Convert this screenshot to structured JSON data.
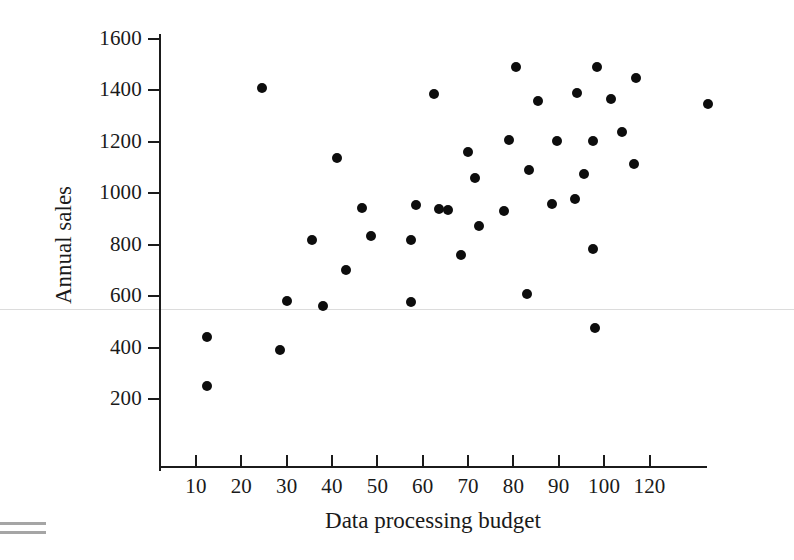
{
  "chart_data": {
    "type": "scatter",
    "title": "",
    "xlabel": "Data processing budget",
    "ylabel": "Annual sales",
    "xlim": [
      0,
      130
    ],
    "ylim": [
      0,
      1700
    ],
    "grid": false,
    "legend": "none",
    "marker": "filled-circle",
    "marker_color": "#0d0d0d",
    "xticks": [
      10,
      20,
      30,
      40,
      50,
      60,
      70,
      80,
      90,
      100,
      120
    ],
    "xtick_labels": [
      "10",
      "20",
      "30",
      "40",
      "50",
      "60",
      "70",
      "80",
      "90",
      "100",
      "120"
    ],
    "yticks": [
      200,
      400,
      600,
      800,
      1000,
      1200,
      1400,
      1600
    ],
    "ytick_labels": [
      "200",
      "400",
      "600",
      "800",
      "1000",
      "1200",
      "1400",
      "1600"
    ],
    "n_points": 44,
    "points": [
      {
        "x": 12.5,
        "y": 440
      },
      {
        "x": 12.5,
        "y": 250
      },
      {
        "x": 24.5,
        "y": 1410
      },
      {
        "x": 28.5,
        "y": 392
      },
      {
        "x": 30.0,
        "y": 583
      },
      {
        "x": 35.5,
        "y": 818
      },
      {
        "x": 38.0,
        "y": 563
      },
      {
        "x": 41.0,
        "y": 1138
      },
      {
        "x": 43.0,
        "y": 703
      },
      {
        "x": 46.5,
        "y": 944
      },
      {
        "x": 48.5,
        "y": 833
      },
      {
        "x": 57.5,
        "y": 578
      },
      {
        "x": 57.5,
        "y": 818
      },
      {
        "x": 58.5,
        "y": 953
      },
      {
        "x": 62.5,
        "y": 1385
      },
      {
        "x": 63.5,
        "y": 940
      },
      {
        "x": 65.5,
        "y": 935
      },
      {
        "x": 68.5,
        "y": 760
      },
      {
        "x": 70.0,
        "y": 1160
      },
      {
        "x": 71.5,
        "y": 1060
      },
      {
        "x": 72.5,
        "y": 872
      },
      {
        "x": 78.0,
        "y": 932
      },
      {
        "x": 79.0,
        "y": 1207
      },
      {
        "x": 80.5,
        "y": 1490
      },
      {
        "x": 83.0,
        "y": 607
      },
      {
        "x": 83.5,
        "y": 1092
      },
      {
        "x": 85.5,
        "y": 1357
      },
      {
        "x": 88.5,
        "y": 958
      },
      {
        "x": 89.5,
        "y": 1203
      },
      {
        "x": 93.5,
        "y": 977
      },
      {
        "x": 94.0,
        "y": 1390
      },
      {
        "x": 95.5,
        "y": 1076
      },
      {
        "x": 97.5,
        "y": 1203
      },
      {
        "x": 97.5,
        "y": 785
      },
      {
        "x": 98.0,
        "y": 478
      },
      {
        "x": 98.5,
        "y": 1490
      },
      {
        "x": 101.5,
        "y": 1365
      },
      {
        "x": 104.0,
        "y": 1240
      },
      {
        "x": 106.5,
        "y": 1113
      },
      {
        "x": 107.0,
        "y": 1450
      },
      {
        "x": 123.0,
        "y": 1348
      }
    ]
  },
  "axes": {
    "x_title": "Data processing budget",
    "y_title": "Annual sales"
  },
  "artifacts": {
    "equals_mark": "="
  }
}
